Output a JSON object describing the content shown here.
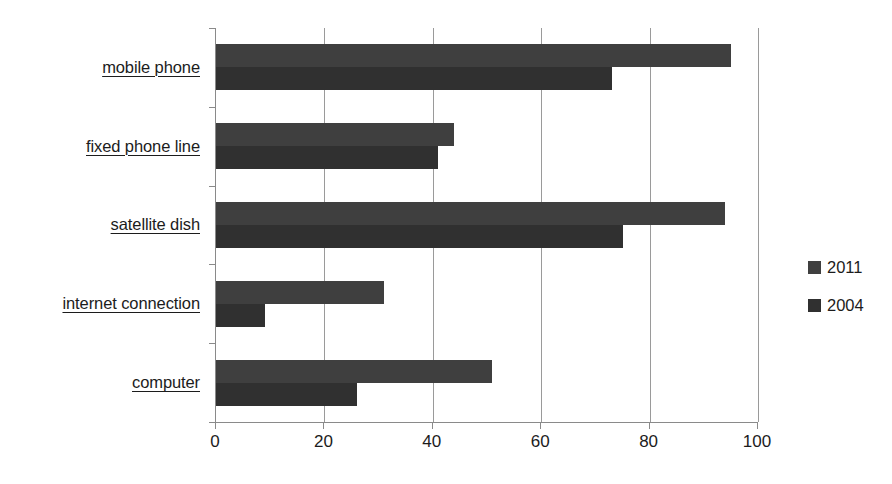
{
  "chart_data": {
    "type": "bar",
    "orientation": "horizontal",
    "title": "",
    "xlabel": "",
    "ylabel": "",
    "xlim": [
      0,
      100
    ],
    "xticks": [
      "0",
      "20",
      "40",
      "60",
      "80",
      "100"
    ],
    "xtick_values": [
      0,
      20,
      40,
      60,
      80,
      100
    ],
    "grid": true,
    "legend_position": "right",
    "categories": [
      "mobile phone",
      "fixed phone line",
      "satellite dish",
      "internet connection",
      "computer"
    ],
    "series": [
      {
        "name": "2011",
        "color": "#3f3f3f",
        "values": [
          95,
          44,
          94,
          31,
          51
        ]
      },
      {
        "name": "2004",
        "color": "#303030",
        "values": [
          73,
          41,
          75,
          9,
          26
        ]
      }
    ]
  },
  "legend": {
    "items": [
      {
        "label": "2011",
        "color": "#3f3f3f"
      },
      {
        "label": "2004",
        "color": "#303030"
      }
    ]
  }
}
